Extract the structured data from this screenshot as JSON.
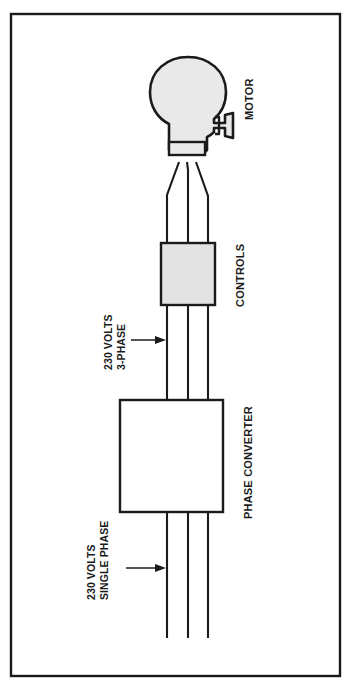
{
  "figure": {
    "background_color": "#ffffff",
    "frame_color": "#1a1a1a",
    "line_color": "#1b1b1b",
    "fill_gray": "#e9e9e9",
    "fill_white": "#ffffff"
  },
  "labels": {
    "motor": "MOTOR",
    "controls": "CONTROLS",
    "phase_converter": "PHASE CONVERTER",
    "supply_three_phase_line1": "230 VOLTS",
    "supply_three_phase_line2": "3-PHASE",
    "supply_single_phase_line1": "230 VOLTS",
    "supply_single_phase_line2": "SINGLE PHASE"
  },
  "components": [
    {
      "name": "motor",
      "label": "MOTOR",
      "shape": "motor-outline",
      "fill": "#e9e9e9",
      "conductor_count": 3
    },
    {
      "name": "controls",
      "label": "CONTROLS",
      "shape": "rectangle",
      "fill": "#e3e3e3",
      "conductor_count": 3
    },
    {
      "name": "phase-converter",
      "label": "PHASE CONVERTER",
      "shape": "rectangle",
      "fill": "#ffffff",
      "conductor_count": 3
    }
  ],
  "annotations": [
    {
      "name": "three-phase-supply",
      "line1": "230 VOLTS",
      "line2": "3-PHASE",
      "arrow": "points-right-to-conductor"
    },
    {
      "name": "single-phase-supply",
      "line1": "230 VOLTS",
      "line2": "SINGLE PHASE",
      "arrow": "points-right-to-conductor"
    }
  ],
  "conductors": {
    "count": 3,
    "description": "Three vertical conductors run from the bottom edge through the phase converter and controls to the motor terminal box."
  }
}
